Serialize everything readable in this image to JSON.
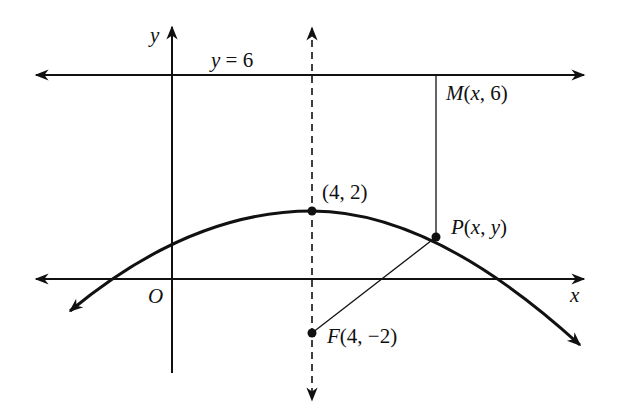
{
  "diagram": {
    "type": "parabola-focus-directrix",
    "axes": {
      "x_label": "x",
      "y_label": "y",
      "origin_label": "O"
    },
    "directrix": {
      "label": "y = 6",
      "equation_y": 6
    },
    "vertex": {
      "label": "(4, 2)",
      "x": 4,
      "y": 2
    },
    "focus": {
      "label": "F(4, −2)",
      "name": "F",
      "x": 4,
      "y": -2
    },
    "point_on_curve": {
      "label": "P(x, y)",
      "name": "P"
    },
    "foot_on_directrix": {
      "label": "M(x, 6)",
      "name": "M"
    },
    "axis_of_symmetry": {
      "x": 4,
      "style": "dashed"
    }
  },
  "labels": {
    "y_axis": "y",
    "x_axis": "x",
    "origin": "O",
    "directrix_y": "y",
    "directrix_eq": " = 6",
    "vertex": "(4, 2)",
    "p_name": "P",
    "p_coords_open": "(",
    "p_x": "x",
    "p_sep": ", ",
    "p_y": "y",
    "p_close": ")",
    "m_name": "M",
    "m_open": "(",
    "m_x": "x",
    "m_rest": ", 6)",
    "f_name": "F",
    "f_coords": "(4, −2)"
  },
  "colors": {
    "stroke": "#111111",
    "background": "#ffffff"
  }
}
